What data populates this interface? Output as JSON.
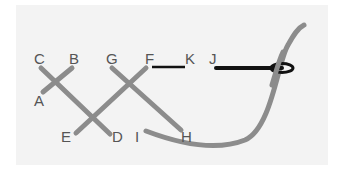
{
  "diagram": {
    "type": "stitch-diagram",
    "colors": {
      "background": "#ffffff",
      "panel": "#f3f3f3",
      "stitch": "#8c8c8c",
      "thread": "#111111",
      "label": "#555555"
    },
    "labels": {
      "A": "A",
      "B": "B",
      "C": "C",
      "D": "D",
      "E": "E",
      "F": "F",
      "G": "G",
      "H": "H",
      "I": "I",
      "J": "J",
      "K": "K"
    }
  }
}
